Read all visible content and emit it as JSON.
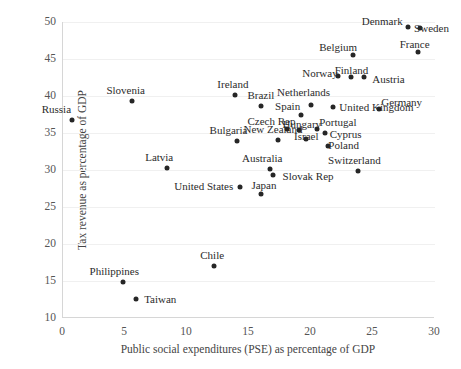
{
  "chart_data": {
    "type": "scatter",
    "title": "",
    "xlabel": "Public social expenditures (PSE) as percentage of GDP",
    "ylabel": "Tax revenue as percentage of GDP",
    "xlim": [
      0,
      30
    ],
    "ylim": [
      10,
      50
    ],
    "xticks": [
      0,
      5,
      10,
      15,
      20,
      25,
      30
    ],
    "yticks": [
      10,
      15,
      20,
      25,
      30,
      35,
      40,
      45,
      50
    ],
    "grid": "horizontal",
    "legend": "none",
    "marker_color": "#262626",
    "points": [
      {
        "label": "Russia",
        "x": 0.7,
        "y": 36.8,
        "lx": -30,
        "ly": -16
      },
      {
        "label": "Slovenia",
        "x": 5.6,
        "y": 39.3,
        "lx": -26,
        "ly": -16
      },
      {
        "label": "Latvia",
        "x": 8.4,
        "y": 30.3,
        "lx": -22,
        "ly": -16
      },
      {
        "label": "Philippines",
        "x": 4.8,
        "y": 14.9,
        "lx": -33,
        "ly": -16
      },
      {
        "label": "Taiwan",
        "x": 5.9,
        "y": 12.6,
        "lx": 8,
        "ly": -5
      },
      {
        "label": "Chile",
        "x": 12.2,
        "y": 17.0,
        "lx": -14,
        "ly": -16
      },
      {
        "label": "Ireland",
        "x": 13.9,
        "y": 40.2,
        "lx": -18,
        "ly": -16
      },
      {
        "label": "Bulgaria",
        "x": 14.0,
        "y": 33.9,
        "lx": -27,
        "ly": -16
      },
      {
        "label": "Brazil",
        "x": 16.0,
        "y": 38.6,
        "lx": -14,
        "ly": -16
      },
      {
        "label": "United States",
        "x": 14.3,
        "y": 27.7,
        "lx": -66,
        "ly": -6
      },
      {
        "label": "Japan",
        "x": 16.0,
        "y": 26.8,
        "lx": -10,
        "ly": -14
      },
      {
        "label": "Australia",
        "x": 16.7,
        "y": 30.2,
        "lx": -28,
        "ly": -16
      },
      {
        "label": "Slovak Rep",
        "x": 16.9,
        "y": 29.3,
        "lx": 10,
        "ly": -4
      },
      {
        "label": "New Zealand",
        "x": 17.3,
        "y": 34.0,
        "lx": -34,
        "ly": -16
      },
      {
        "label": "Czech Rep",
        "x": 18.1,
        "y": 35.6,
        "lx": -40,
        "ly": -13
      },
      {
        "label": "Hungary",
        "x": 19.0,
        "y": 35.4,
        "lx": -16,
        "ly": -11
      },
      {
        "label": "Spain",
        "x": 19.2,
        "y": 37.4,
        "lx": -26,
        "ly": -14
      },
      {
        "label": "Israel",
        "x": 19.6,
        "y": 34.2,
        "lx": -12,
        "ly": -8
      },
      {
        "label": "Netherlands",
        "x": 20.0,
        "y": 38.8,
        "lx": -34,
        "ly": -18
      },
      {
        "label": "Portugal",
        "x": 20.5,
        "y": 35.6,
        "lx": 2,
        "ly": -12
      },
      {
        "label": "Cyprus",
        "x": 21.1,
        "y": 35.0,
        "lx": 5,
        "ly": -4
      },
      {
        "label": "Poland",
        "x": 21.4,
        "y": 33.3,
        "lx": 0,
        "ly": -6
      },
      {
        "label": "United Kingdom",
        "x": 21.8,
        "y": 38.5,
        "lx": 6,
        "ly": -5
      },
      {
        "label": "Norway",
        "x": 22.2,
        "y": 42.7,
        "lx": -36,
        "ly": -8
      },
      {
        "label": "Finland",
        "x": 23.2,
        "y": 42.6,
        "lx": -16,
        "ly": -12
      },
      {
        "label": "Belgium",
        "x": 23.4,
        "y": 45.6,
        "lx": -34,
        "ly": -13
      },
      {
        "label": "Switzerland",
        "x": 23.8,
        "y": 29.9,
        "lx": -30,
        "ly": -16
      },
      {
        "label": "Austria",
        "x": 24.3,
        "y": 42.6,
        "lx": 8,
        "ly": -3
      },
      {
        "label": "Germany",
        "x": 25.5,
        "y": 38.2,
        "lx": 2,
        "ly": -12
      },
      {
        "label": "Denmark",
        "x": 27.8,
        "y": 49.3,
        "lx": -46,
        "ly": -11
      },
      {
        "label": "Sweden",
        "x": 28.8,
        "y": 49.2,
        "lx": -6,
        "ly": -5
      },
      {
        "label": "France",
        "x": 28.6,
        "y": 46.0,
        "lx": -18,
        "ly": -13
      }
    ]
  }
}
